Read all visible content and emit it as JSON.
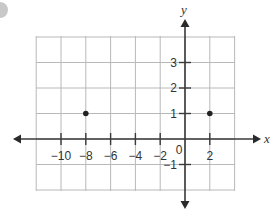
{
  "chart_data": {
    "type": "scatter",
    "title": "",
    "xlabel": "x",
    "ylabel": "y",
    "grid": true,
    "xlim": [
      -12,
      4
    ],
    "ylim": [
      -2,
      4
    ],
    "x_tick_labels": [
      "-10",
      "-8",
      "-6",
      "-4",
      "-2",
      "0",
      "2"
    ],
    "x_ticks": [
      -10,
      -8,
      -6,
      -4,
      -2,
      2
    ],
    "y_tick_labels": [
      "3",
      "2",
      "1",
      "-1"
    ],
    "y_ticks": [
      3,
      2,
      1,
      -1
    ],
    "origin_label": "0",
    "points": [
      {
        "x": -8,
        "y": 1
      },
      {
        "x": 2,
        "y": 1
      }
    ],
    "series": [
      {
        "name": "points",
        "x": [
          -8,
          2
        ],
        "y": [
          1,
          1
        ]
      }
    ]
  },
  "labels": {
    "x_axis": "x",
    "y_axis": "y",
    "origin": "0",
    "x_ticks": [
      "−10",
      "−8",
      "−6",
      "−4",
      "−2",
      "2"
    ],
    "y_ticks": [
      "3",
      "2",
      "1",
      "−1"
    ]
  },
  "colors": {
    "grid": "#b8b8b8",
    "axis": "#3a3a3a",
    "point": "#222222",
    "badge": "#c8c8c8"
  }
}
